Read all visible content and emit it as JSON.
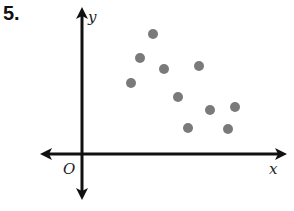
{
  "problem": {
    "number": "5."
  },
  "axes": {
    "x_label": "x",
    "y_label": "y",
    "origin_label": "O"
  },
  "colors": {
    "axis": "#111111",
    "point": "#7a7a7a"
  },
  "chart_data": {
    "type": "scatter",
    "title": "",
    "xlabel": "x",
    "ylabel": "y",
    "grid": false,
    "legend": null,
    "axis_ticks": "none (unlabeled axes)",
    "note": "Values are relative positions estimated from pixel offsets from origin O (1 unit ≈ 10 px); axes have no tick marks.",
    "points": [
      {
        "x": 4.9,
        "y": 7.1
      },
      {
        "x": 5.8,
        "y": 9.6
      },
      {
        "x": 7.1,
        "y": 12.0
      },
      {
        "x": 8.2,
        "y": 8.5
      },
      {
        "x": 9.6,
        "y": 5.7
      },
      {
        "x": 10.6,
        "y": 2.6
      },
      {
        "x": 11.7,
        "y": 8.8
      },
      {
        "x": 12.8,
        "y": 4.4
      },
      {
        "x": 14.6,
        "y": 2.5
      },
      {
        "x": 15.3,
        "y": 4.7
      }
    ],
    "pixel_points": [
      [
        131,
        83
      ],
      [
        140,
        58
      ],
      [
        153,
        34
      ],
      [
        164,
        69
      ],
      [
        178,
        97
      ],
      [
        188,
        128
      ],
      [
        199,
        66
      ],
      [
        210,
        110
      ],
      [
        228,
        129
      ],
      [
        235,
        107
      ]
    ],
    "origin_px": [
      82,
      154
    ],
    "xlim": [
      -4,
      20.4
    ],
    "ylim": [
      -4.4,
      14.6
    ]
  }
}
